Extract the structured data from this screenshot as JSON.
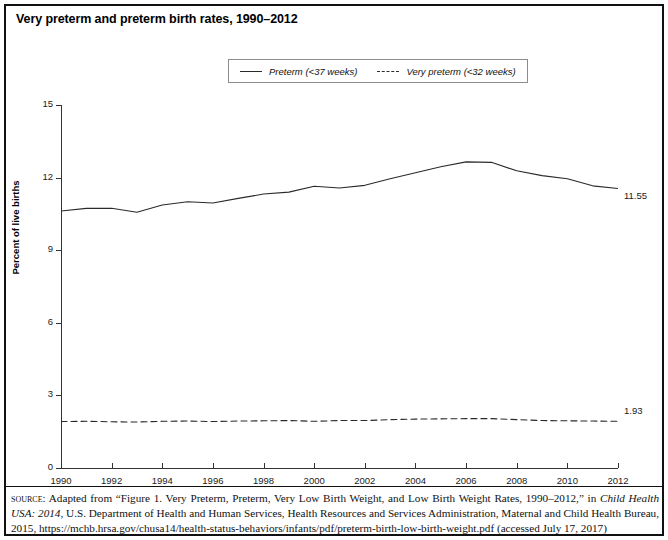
{
  "title": "Very preterm and preterm birth rates, 1990–2012",
  "legend": {
    "items": [
      {
        "label": "Preterm (<37 weeks)",
        "style": "solid",
        "swatch_name": "solid-line-swatch"
      },
      {
        "label": "Very preterm (<32 weeks)",
        "style": "dashed",
        "swatch_name": "dashed-line-swatch"
      }
    ]
  },
  "axes": {
    "ylabel": "Percent of live births",
    "yticks": [
      "0",
      "3",
      "6",
      "9",
      "12",
      "15"
    ],
    "xticks": [
      "1990",
      "1992",
      "1994",
      "1996",
      "1998",
      "2000",
      "2002",
      "2004",
      "2006",
      "2008",
      "2010",
      "2012"
    ]
  },
  "end_labels": {
    "preterm": "11.55",
    "very_preterm": "1.93"
  },
  "source": {
    "label": "source",
    "text_1": ": Adapted from “Figure 1. Very Preterm, Preterm, Very Low Birth Weight, and Low Birth Weight Rates, 1990–2012,” in ",
    "italic_1": "Child Health USA: 2014",
    "text_2": ", U.S. Department of Health and Human Services, Health Resources and Services Administration, Maternal and Child Health Bureau, 2015, https://mchb.hrsa.gov/chusa14/health-status-behaviors/infants/pdf/preterm-birth-low-birth-weight.pdf (accessed July 17, 2017)"
  },
  "chart_data": {
    "type": "line",
    "title": "Very preterm and preterm birth rates, 1990–2012",
    "xlabel": "",
    "ylabel": "Percent of live births",
    "xlim": [
      1990,
      2012
    ],
    "ylim": [
      0,
      15
    ],
    "grid": false,
    "legend_position": "top-center",
    "x": [
      1990,
      1991,
      1992,
      1993,
      1994,
      1995,
      1996,
      1997,
      1998,
      1999,
      2000,
      2001,
      2002,
      2003,
      2004,
      2005,
      2006,
      2007,
      2008,
      2009,
      2010,
      2011,
      2012
    ],
    "series": [
      {
        "name": "Preterm (<37 weeks)",
        "style": "solid",
        "end_label": "11.55",
        "values": [
          10.62,
          10.73,
          10.73,
          10.57,
          10.87,
          11.0,
          10.95,
          11.14,
          11.32,
          11.4,
          11.64,
          11.57,
          11.68,
          11.95,
          12.2,
          12.45,
          12.65,
          12.63,
          12.28,
          12.08,
          11.95,
          11.66,
          11.55
        ]
      },
      {
        "name": "Very preterm (<32 weeks)",
        "style": "dashed",
        "end_label": "1.93",
        "values": [
          1.92,
          1.93,
          1.91,
          1.9,
          1.93,
          1.94,
          1.92,
          1.94,
          1.95,
          1.96,
          1.93,
          1.96,
          1.96,
          2.0,
          2.02,
          2.03,
          2.04,
          2.04,
          2.0,
          1.96,
          1.95,
          1.94,
          1.93
        ]
      }
    ]
  }
}
